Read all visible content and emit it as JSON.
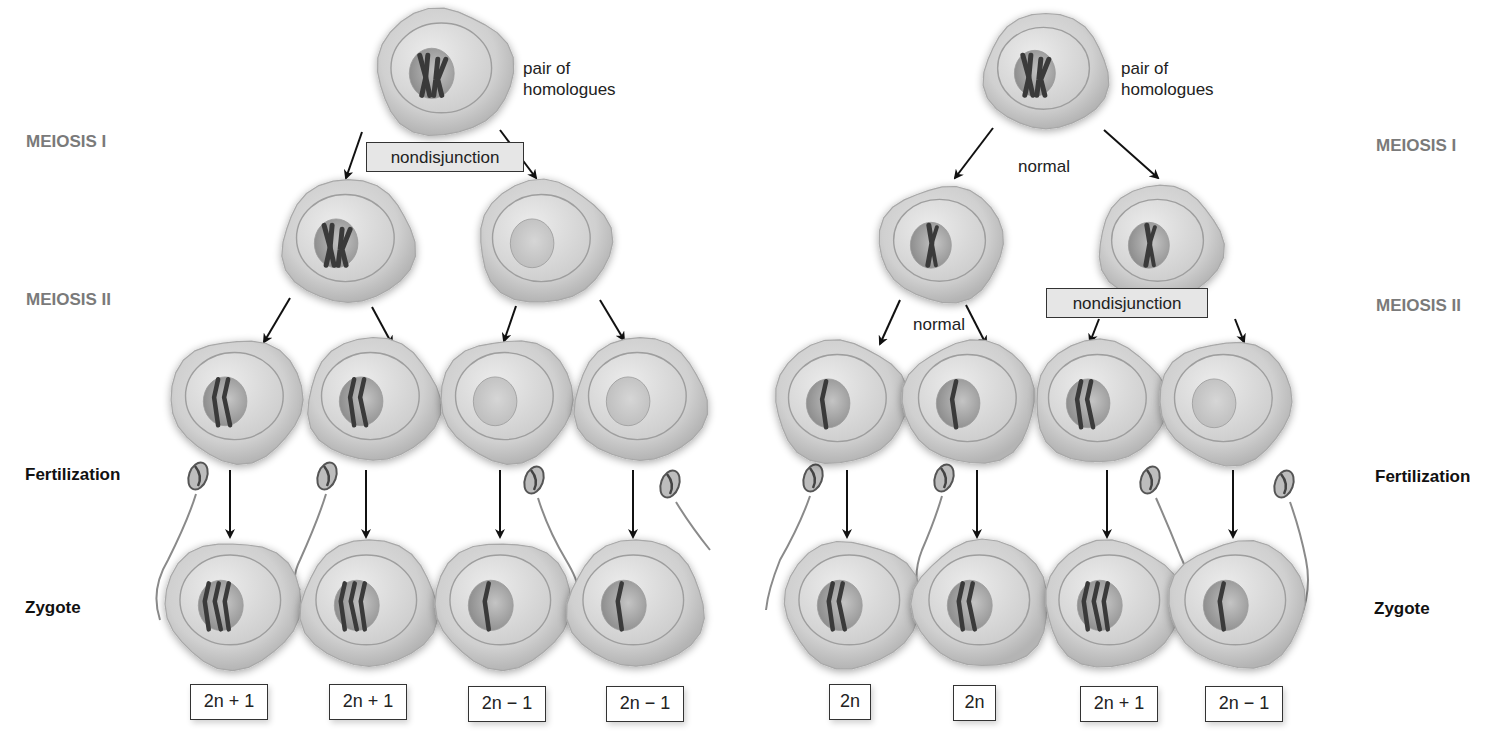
{
  "figure": {
    "stage_labels": {
      "meiosis_1": "MEIOSIS I",
      "meiosis_2": "MEIOSIS II",
      "fertilization": "Fertilization",
      "zygote": "Zygote"
    },
    "colors": {
      "cell_fill": "#d2d2d2",
      "cell_edge": "#a8a8a8",
      "nucleus": "#9c9c9c",
      "chromosome": "#3a3a3a",
      "stage_label_gray": "#7a7a7a",
      "box_fill": "#e6e6e6"
    }
  },
  "left_panel": {
    "name": "Nondisjunction in meiosis I",
    "parent_annotation": [
      "pair of",
      "homologues"
    ],
    "meiosis_1_event": "nondisjunction",
    "meiosis_2_event": "",
    "parent_cell": {
      "chromosomes": "homologous pair (2 duplicated)"
    },
    "meiosis_1_products": [
      {
        "chromosomes": 2,
        "description": "both homologues"
      },
      {
        "chromosomes": 0,
        "description": "no homologue"
      }
    ],
    "gametes": [
      {
        "chromosomes": 2
      },
      {
        "chromosomes": 2
      },
      {
        "chromosomes": 0
      },
      {
        "chromosomes": 0
      }
    ],
    "zygotes": [
      {
        "chromosomes": 3,
        "ploidy": "2n + 1"
      },
      {
        "chromosomes": 3,
        "ploidy": "2n + 1"
      },
      {
        "chromosomes": 1,
        "ploidy": "2n − 1"
      },
      {
        "chromosomes": 1,
        "ploidy": "2n − 1"
      }
    ]
  },
  "right_panel": {
    "name": "Nondisjunction in meiosis II",
    "parent_annotation": [
      "pair of",
      "homologues"
    ],
    "meiosis_1_event": "normal",
    "meiosis_2_events": [
      "normal",
      "nondisjunction"
    ],
    "parent_cell": {
      "chromosomes": "homologous pair (2 duplicated)"
    },
    "meiosis_1_products": [
      {
        "chromosomes": 1,
        "description": "one duplicated chromosome"
      },
      {
        "chromosomes": 1,
        "description": "one duplicated chromosome"
      }
    ],
    "gametes": [
      {
        "chromosomes": 1
      },
      {
        "chromosomes": 1
      },
      {
        "chromosomes": 2
      },
      {
        "chromosomes": 0
      }
    ],
    "zygotes": [
      {
        "chromosomes": 2,
        "ploidy": "2n"
      },
      {
        "chromosomes": 2,
        "ploidy": "2n"
      },
      {
        "chromosomes": 3,
        "ploidy": "2n + 1"
      },
      {
        "chromosomes": 1,
        "ploidy": "2n − 1"
      }
    ]
  }
}
